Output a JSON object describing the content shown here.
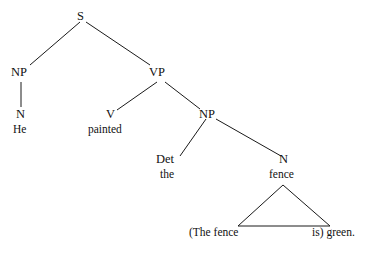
{
  "figure": {
    "type": "constituency-syntax-tree",
    "background_color": "#ffffff",
    "line_color": "#1a1a1a",
    "text_color": "#111111"
  },
  "nodes": {
    "s": "S",
    "np_subject": "NP",
    "vp": "VP",
    "n_subject": "N",
    "v": "V",
    "np_object": "NP",
    "det": "Det",
    "n_object": "N"
  },
  "terminals": {
    "he": "He",
    "painted": "painted",
    "the": "the",
    "fence": "fence"
  },
  "triangle_gloss": {
    "left": "(The fence",
    "right": "is) green."
  }
}
